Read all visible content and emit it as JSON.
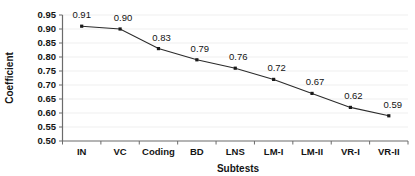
{
  "chart_data": {
    "type": "line",
    "title": "",
    "xlabel": "Subtests",
    "ylabel": "Coefficient",
    "categories": [
      "IN",
      "VC",
      "Coding",
      "BD",
      "LNS",
      "LM-I",
      "LM-II",
      "VR-I",
      "VR-II"
    ],
    "values": [
      0.91,
      0.9,
      0.83,
      0.79,
      0.76,
      0.72,
      0.67,
      0.62,
      0.59
    ],
    "point_labels": [
      "0.91",
      "0.90",
      "0.83",
      "0.79",
      "0.76",
      "0.72",
      "0.67",
      "0.62",
      "0.59"
    ],
    "ylim": [
      0.5,
      0.95
    ],
    "ytick_labels": [
      "0.95",
      "0.90",
      "0.85",
      "0.80",
      "0.75",
      "0.70",
      "0.65",
      "0.60",
      "0.55",
      "0.50"
    ],
    "ytick_values": [
      0.95,
      0.9,
      0.85,
      0.8,
      0.75,
      0.7,
      0.65,
      0.6,
      0.55,
      0.5
    ],
    "ytick_step": 0.05,
    "grid": true,
    "legend": false,
    "series": [
      {
        "name": "Coefficient",
        "values": [
          0.91,
          0.9,
          0.83,
          0.79,
          0.76,
          0.72,
          0.67,
          0.62,
          0.59
        ]
      }
    ],
    "colors": {
      "line": "#2b2b2b",
      "marker": "#1a1a1a",
      "grid": "#e8e8e8",
      "axis": "#6b6b6b",
      "text": "#141414",
      "background": "#ffffff"
    }
  }
}
